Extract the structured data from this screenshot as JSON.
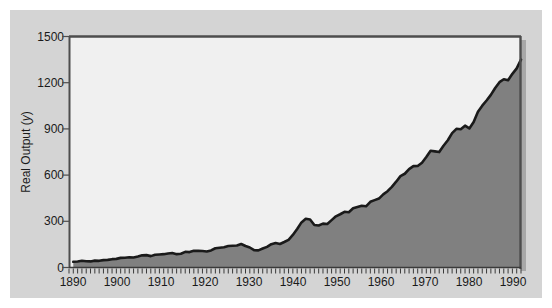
{
  "figure": {
    "background_color": "#ffffff",
    "panel_color": "#d4d4d4",
    "plot_background_color": "#f0f0f0",
    "fill_color": "#808080",
    "line_color": "#1a1a1a",
    "axis_color": "#4d4d4d"
  },
  "chart_data": {
    "type": "area",
    "title": "",
    "subtitle": "",
    "xlabel": "",
    "ylabel": "Real Output (y)",
    "ylabel_parts": {
      "text": "Real Output (",
      "italic": "y",
      "tail": ")"
    },
    "xlim": [
      1889,
      1994
    ],
    "ylim": [
      0,
      1500
    ],
    "grid": false,
    "legend": null,
    "yticks": [
      0,
      300,
      600,
      900,
      1200,
      1500
    ],
    "ytick_labels": [
      "0",
      "300",
      "600",
      "900",
      "1200",
      "1500"
    ],
    "xticks": [
      1890,
      1900,
      1910,
      1920,
      1930,
      1940,
      1950,
      1960,
      1970,
      1980,
      1990
    ],
    "xtick_labels": [
      "1890",
      "1900",
      "1910",
      "1920",
      "1930",
      "1940",
      "1950",
      "1960",
      "1970",
      "1980",
      "1990"
    ],
    "x_minor_tick_interval": 1,
    "series": [
      {
        "name": "Real Output (y)",
        "x": [
          1890,
          1891,
          1892,
          1893,
          1894,
          1895,
          1896,
          1897,
          1898,
          1899,
          1900,
          1901,
          1902,
          1903,
          1904,
          1905,
          1906,
          1907,
          1908,
          1909,
          1910,
          1911,
          1912,
          1913,
          1914,
          1915,
          1916,
          1917,
          1918,
          1919,
          1920,
          1921,
          1922,
          1923,
          1924,
          1925,
          1926,
          1927,
          1928,
          1929,
          1930,
          1931,
          1932,
          1933,
          1934,
          1935,
          1936,
          1937,
          1938,
          1939,
          1940,
          1941,
          1942,
          1943,
          1944,
          1945,
          1946,
          1947,
          1948,
          1949,
          1950,
          1951,
          1952,
          1953,
          1954,
          1955,
          1956,
          1957,
          1958,
          1959,
          1960,
          1961,
          1962,
          1963,
          1964,
          1965,
          1966,
          1967,
          1968,
          1969,
          1970,
          1971,
          1972,
          1973,
          1974,
          1975,
          1976,
          1977,
          1978,
          1979,
          1980,
          1981,
          1982,
          1983,
          1984,
          1985,
          1986,
          1987,
          1988,
          1989,
          1990,
          1991,
          1992,
          1993,
          1994
        ],
        "values": [
          58,
          62,
          68,
          64,
          62,
          70,
          68,
          75,
          78,
          85,
          88,
          98,
          100,
          104,
          102,
          112,
          124,
          126,
          116,
          130,
          133,
          136,
          143,
          147,
          136,
          140,
          160,
          157,
          170,
          170,
          168,
          164,
          174,
          196,
          202,
          207,
          220,
          222,
          225,
          240,
          219,
          204,
          177,
          175,
          193,
          210,
          238,
          250,
          240,
          260,
          282,
          332,
          393,
          460,
          497,
          490,
          433,
          429,
          447,
          444,
          483,
          522,
          543,
          568,
          564,
          604,
          617,
          630,
          624,
          670,
          687,
          703,
          746,
          778,
          823,
          875,
          932,
          956,
          1003,
          1034,
          1035,
          1069,
          1126,
          1190,
          1184,
          1177,
          1242,
          1298,
          1370,
          1414,
          1409,
          1446,
          1418,
          1484,
          1589,
          1650,
          1703,
          1760,
          1830,
          1890,
          1920,
          1910,
          1975,
          2030,
          2120
        ]
      }
    ],
    "note": "Series plotted rescaled to the 0-1500 axis; rendered path follows the drawn curve."
  },
  "axis": {
    "y_title": "Real Output (y)"
  }
}
